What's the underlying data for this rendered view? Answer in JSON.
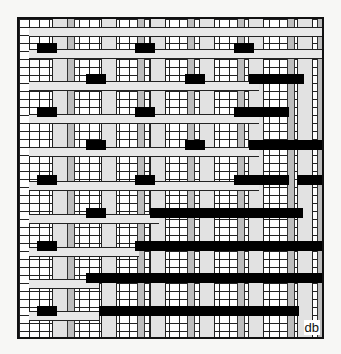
{
  "diagram": {
    "signature": "db",
    "vstrips": [
      33,
      82,
      131,
      180,
      229,
      278
    ],
    "dotted": [
      48,
      118,
      168,
      218,
      268,
      298
    ],
    "hstrips": [
      [
        8,
        10,
        300
      ],
      [
        30,
        10,
        300
      ],
      [
        62,
        10,
        230
      ],
      [
        95,
        10,
        230
      ],
      [
        128,
        10,
        230
      ],
      [
        162,
        10,
        230
      ],
      [
        195,
        10,
        130
      ],
      [
        228,
        10,
        110
      ],
      [
        260,
        10,
        70
      ],
      [
        292,
        10,
        70
      ]
    ],
    "bars": [
      [
        24,
        18,
        20
      ],
      [
        24,
        116,
        20
      ],
      [
        24,
        215,
        20
      ],
      [
        55,
        67,
        20
      ],
      [
        55,
        166,
        20
      ],
      [
        55,
        230,
        55
      ],
      [
        88,
        18,
        20
      ],
      [
        88,
        116,
        20
      ],
      [
        88,
        215,
        55
      ],
      [
        121,
        67,
        20
      ],
      [
        121,
        166,
        20
      ],
      [
        121,
        230,
        73
      ],
      [
        156,
        18,
        20
      ],
      [
        156,
        116,
        20
      ],
      [
        156,
        215,
        55
      ],
      [
        156,
        278,
        25
      ],
      [
        189,
        67,
        20
      ],
      [
        189,
        131,
        153
      ],
      [
        222,
        18,
        20
      ],
      [
        222,
        116,
        187
      ],
      [
        254,
        67,
        236
      ],
      [
        287,
        18,
        20
      ],
      [
        287,
        80,
        200
      ]
    ]
  }
}
